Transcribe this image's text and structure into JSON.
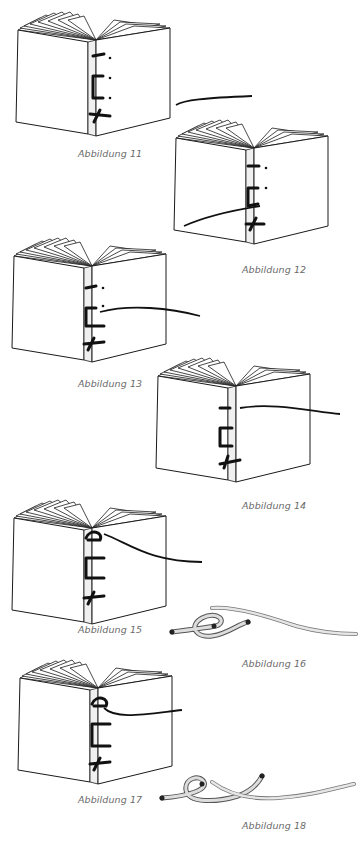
{
  "figures": [
    {
      "id": 11,
      "caption": "Abbildung 11",
      "subject": "open-book-stitching-step"
    },
    {
      "id": 12,
      "caption": "Abbildung 12",
      "subject": "open-book-stitching-step"
    },
    {
      "id": 13,
      "caption": "Abbildung 13",
      "subject": "open-book-stitching-step"
    },
    {
      "id": 14,
      "caption": "Abbildung 14",
      "subject": "open-book-stitching-step"
    },
    {
      "id": 15,
      "caption": "Abbildung 15",
      "subject": "open-book-stitching-step"
    },
    {
      "id": 16,
      "caption": "Abbildung 16",
      "subject": "thread-loop-detail"
    },
    {
      "id": 17,
      "caption": "Abbildung 17",
      "subject": "open-book-stitching-step"
    },
    {
      "id": 18,
      "caption": "Abbildung 18",
      "subject": "thread-knot-detail"
    }
  ],
  "colors": {
    "line": "#1a1a1a",
    "thread": "#111111",
    "caption": "#6a6a6a",
    "cord": "#cfcfcf"
  }
}
